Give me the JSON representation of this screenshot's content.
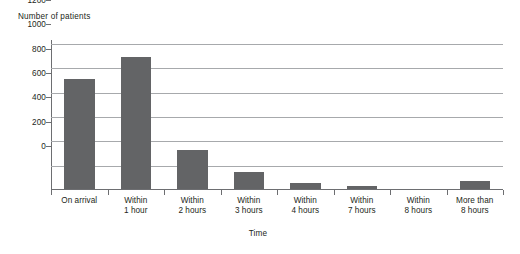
{
  "chart_data": {
    "type": "bar",
    "title": "",
    "xlabel": "Time",
    "ylabel": "Number of patients",
    "categories": [
      "On arrival",
      "Within 1 hour",
      "Within 2 hours",
      "Within 3 hours",
      "Within 4 hours",
      "Within 7 hours",
      "Within 8 hours",
      "More than 8 hours"
    ],
    "category_lines": [
      [
        "On arrival",
        ""
      ],
      [
        "Within",
        "1 hour"
      ],
      [
        "Within",
        "2 hours"
      ],
      [
        "Within",
        "3 hours"
      ],
      [
        "Within",
        "4 hours"
      ],
      [
        "Within",
        "7 hours"
      ],
      [
        "Within",
        "8 hours"
      ],
      [
        "More than",
        "8 hours"
      ]
    ],
    "values": [
      910,
      1090,
      330,
      150,
      55,
      30,
      0,
      75
    ],
    "ylim": [
      0,
      1200
    ],
    "yticks": [
      0,
      200,
      400,
      600,
      800,
      1000,
      1200
    ],
    "ytick_labels": [
      "0",
      "200",
      "400",
      "600",
      "800",
      "1000",
      "1200"
    ],
    "grid": true,
    "legend": false,
    "bar_color": "#636466",
    "gridline_color": "#a7a9ac",
    "axis_color": "#6d6e71",
    "text_color": "#231f20",
    "background": "#ffffff"
  }
}
